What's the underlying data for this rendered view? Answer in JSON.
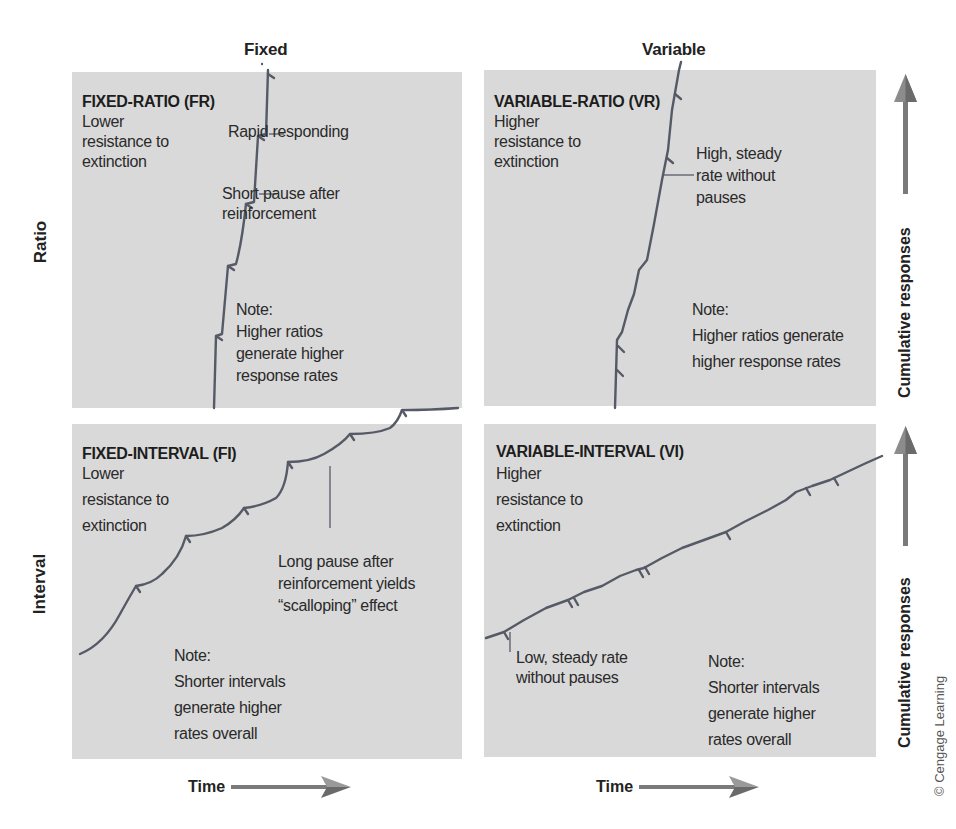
{
  "columns": {
    "fixed": "Fixed",
    "variable": "Variable"
  },
  "rows": {
    "ratio": "Ratio",
    "interval": "Interval"
  },
  "axes": {
    "x_label": "Time",
    "y_label": "Cumulative responses"
  },
  "credit": "© Cengage Learning",
  "colors": {
    "panel_bg": "#d9d9d9",
    "line": "#555a66",
    "arrow": "#7a7a7a"
  },
  "panels": {
    "fr": {
      "title": "FIXED-RATIO (FR)",
      "desc": [
        "Lower",
        "resistance to",
        "extinction"
      ],
      "callouts": {
        "c1": "Rapid responding",
        "c2": [
          "Short pause after",
          "reinforcement"
        ]
      },
      "note": [
        "Note:",
        "Higher ratios",
        "generate higher",
        "response rates"
      ]
    },
    "vr": {
      "title": "VARIABLE-RATIO (VR)",
      "desc": [
        "Higher",
        "resistance to",
        "extinction"
      ],
      "callouts": {
        "c1": [
          "High, steady",
          "rate without",
          "pauses"
        ]
      },
      "note": [
        "Note:",
        "Higher ratios generate",
        "higher response rates"
      ]
    },
    "fi": {
      "title": "FIXED-INTERVAL (FI)",
      "desc": [
        "Lower",
        "resistance to",
        "extinction"
      ],
      "callouts": {
        "c1": [
          "Long pause after",
          "reinforcement yields",
          "“scalloping” effect"
        ]
      },
      "note": [
        "Note:",
        "Shorter intervals",
        "generate higher",
        "rates overall"
      ]
    },
    "vi": {
      "title": "VARIABLE-INTERVAL (VI)",
      "desc": [
        "Higher",
        "resistance to",
        "extinction"
      ],
      "callouts": {
        "c1": [
          "Low, steady rate",
          "without pauses"
        ]
      },
      "note": [
        "Note:",
        "Shorter intervals",
        "generate higher",
        "rates overall"
      ]
    }
  }
}
